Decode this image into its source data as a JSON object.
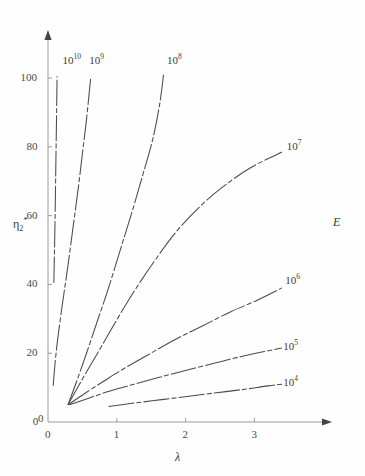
{
  "chart_data": {
    "type": "line",
    "title": "",
    "xlabel": "λ",
    "ylabel": "η₂*",
    "right_annotation": "E",
    "xlim": [
      0,
      3.75
    ],
    "ylim": [
      0,
      107
    ],
    "xticks": [
      0,
      1,
      2,
      3
    ],
    "xtick_labels": [
      "0",
      "1",
      "2",
      "3"
    ],
    "yticks": [
      0,
      20,
      40,
      60,
      80,
      100
    ],
    "ytick_labels": [
      "0",
      "20",
      "40",
      "60",
      "80",
      "100"
    ],
    "grid": false,
    "legend": "inline-end-labels",
    "line_style": "dash-dot",
    "line_color": "#4a4a4a",
    "series": [
      {
        "name": "10^10",
        "label": "10",
        "exponent": "10",
        "label_x": 0.21,
        "label_y": 105.5,
        "points": [
          [
            0.085,
            40.5
          ],
          [
            0.095,
            50.5
          ],
          [
            0.105,
            62.0
          ],
          [
            0.112,
            72.0
          ],
          [
            0.118,
            80.5
          ],
          [
            0.125,
            90.0
          ],
          [
            0.132,
            100.5
          ]
        ]
      },
      {
        "name": "10^9",
        "label": "10",
        "exponent": "9",
        "label_x": 0.6,
        "label_y": 105.5,
        "points": [
          [
            0.075,
            10.5
          ],
          [
            0.12,
            20.5
          ],
          [
            0.2,
            33.0
          ],
          [
            0.28,
            44.0
          ],
          [
            0.36,
            56.0
          ],
          [
            0.44,
            68.0
          ],
          [
            0.5,
            78.0
          ],
          [
            0.56,
            88.0
          ],
          [
            0.62,
            100.0
          ]
        ]
      },
      {
        "name": "10^8",
        "label": "10",
        "exponent": "8",
        "label_x": 1.73,
        "label_y": 105.5,
        "points": [
          [
            0.29,
            5.0
          ],
          [
            0.42,
            12.0
          ],
          [
            0.56,
            20.0
          ],
          [
            0.72,
            29.5
          ],
          [
            0.88,
            39.0
          ],
          [
            1.05,
            50.0
          ],
          [
            1.22,
            61.0
          ],
          [
            1.38,
            72.0
          ],
          [
            1.52,
            82.0
          ],
          [
            1.62,
            92.0
          ],
          [
            1.68,
            101.0
          ]
        ]
      },
      {
        "name": "10^7",
        "label": "10",
        "exponent": "7",
        "label_x": 3.47,
        "label_y": 80.5,
        "points": [
          [
            0.29,
            5.0
          ],
          [
            0.5,
            12.5
          ],
          [
            0.72,
            20.0
          ],
          [
            0.95,
            28.0
          ],
          [
            1.22,
            37.0
          ],
          [
            1.52,
            46.0
          ],
          [
            1.85,
            55.0
          ],
          [
            2.2,
            62.5
          ],
          [
            2.55,
            68.5
          ],
          [
            2.95,
            74.0
          ],
          [
            3.4,
            78.5
          ]
        ]
      },
      {
        "name": "10^6",
        "label": "10",
        "exponent": "6",
        "label_x": 3.45,
        "label_y": 41.5,
        "points": [
          [
            0.29,
            5.0
          ],
          [
            0.55,
            8.5
          ],
          [
            0.82,
            12.0
          ],
          [
            1.1,
            15.5
          ],
          [
            1.45,
            19.5
          ],
          [
            1.85,
            24.0
          ],
          [
            2.25,
            28.0
          ],
          [
            2.65,
            32.0
          ],
          [
            3.05,
            35.5
          ],
          [
            3.4,
            39.0
          ]
        ]
      },
      {
        "name": "10^5",
        "label": "10",
        "exponent": "5",
        "label_x": 3.42,
        "label_y": 22.5,
        "points": [
          [
            0.31,
            5.0
          ],
          [
            0.6,
            7.0
          ],
          [
            0.9,
            9.0
          ],
          [
            1.25,
            11.0
          ],
          [
            1.62,
            13.0
          ],
          [
            2.0,
            15.0
          ],
          [
            2.4,
            17.0
          ],
          [
            2.8,
            19.0
          ],
          [
            3.15,
            20.5
          ],
          [
            3.4,
            21.5
          ]
        ]
      },
      {
        "name": "10^4",
        "label": "10",
        "exponent": "4",
        "label_x": 3.42,
        "label_y": 12.0,
        "points": [
          [
            0.88,
            4.5
          ],
          [
            1.25,
            5.5
          ],
          [
            1.65,
            6.5
          ],
          [
            2.05,
            7.5
          ],
          [
            2.45,
            8.5
          ],
          [
            2.85,
            9.5
          ],
          [
            3.2,
            10.5
          ],
          [
            3.42,
            11.0
          ]
        ]
      }
    ]
  },
  "axes": {
    "x_axis_label": "λ",
    "y_axis_label_base": "η",
    "y_axis_label_sub": "2",
    "y_axis_label_star": "*",
    "family_label": "E",
    "origin_label": "0"
  },
  "colors": {
    "line": "#4a4a4a",
    "axis": "#9a9a9a",
    "text": "#3a3a3a",
    "background": "#fefefe"
  }
}
